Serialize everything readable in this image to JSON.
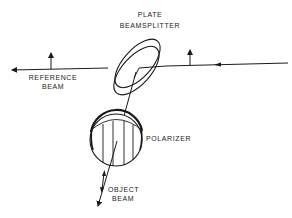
{
  "diagram": {
    "labels": {
      "plate": "PLATE",
      "beamsplitter": "BEAMSPLITTER",
      "reference_line1": "REFERENCE",
      "reference_line2": "BEAM",
      "polarizer": "POLARIZER",
      "object_line1": "OBJECT",
      "object_line2": "BEAM"
    },
    "components": [
      {
        "name": "plate-beamsplitter",
        "shape": "tilted ring"
      },
      {
        "name": "polarizer",
        "shape": "circle with vertical lines"
      }
    ],
    "beams": [
      {
        "name": "input-beam",
        "direction": "right-to-left"
      },
      {
        "name": "reference-beam",
        "direction": "left"
      },
      {
        "name": "object-beam",
        "direction": "down-left"
      }
    ],
    "colors": {
      "stroke": "#1a1a1a",
      "background": "#ffffff"
    }
  }
}
